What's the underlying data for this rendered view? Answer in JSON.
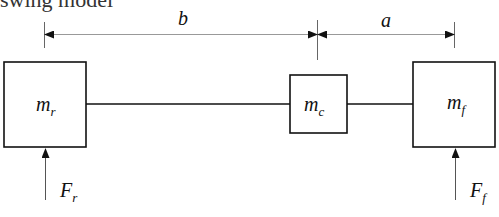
{
  "heading": {
    "text": "swing model"
  },
  "dimensions": [
    {
      "id": "b",
      "label": "b"
    },
    {
      "id": "a",
      "label": "a"
    }
  ],
  "masses": [
    {
      "id": "rear",
      "symbol": "m",
      "subscript": "r"
    },
    {
      "id": "center",
      "symbol": "m",
      "subscript": "c"
    },
    {
      "id": "front",
      "symbol": "m",
      "subscript": "f"
    }
  ],
  "forces": [
    {
      "id": "rear",
      "symbol": "F",
      "subscript": "r"
    },
    {
      "id": "front",
      "symbol": "F",
      "subscript": "f"
    }
  ],
  "colors": {
    "stroke": "#111111",
    "dim_line": "#888888"
  }
}
